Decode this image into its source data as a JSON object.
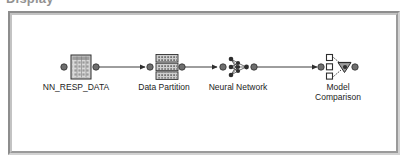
{
  "caption": {
    "text": "Display"
  },
  "frame": {
    "name": "process-flow-diagram",
    "background": "#ffffff",
    "border_shadow": "#8d8d8d",
    "border_highlight": "#d2d2d2"
  },
  "colors": {
    "ink": "#1c1c1c",
    "node_fill": "#b8b8b8",
    "node_fill_light": "#d9d9d9",
    "connector": "#4a4a4a",
    "port": "#6e6e6e",
    "label_text": "#1c1c1c"
  },
  "diagram": {
    "type": "process-flow",
    "nodes": [
      {
        "id": "nn_resp_data",
        "label": "NN_RESP_DATA",
        "icon": "data-table-icon",
        "kind": "input-data-source",
        "x": 66,
        "y": 50
      },
      {
        "id": "data_partition",
        "label": "Data Partition",
        "icon": "data-partition-icon",
        "kind": "sample",
        "x": 152,
        "y": 50
      },
      {
        "id": "neural_network",
        "label": "Neural Network",
        "icon": "neural-network-icon",
        "kind": "model",
        "x": 224,
        "y": 50
      },
      {
        "id": "model_comparison",
        "label": "Model\nComparison",
        "icon": "model-comparison-icon",
        "kind": "assess",
        "x": 324,
        "y": 50
      }
    ],
    "links": [
      {
        "id": "link-1",
        "from": "nn_resp_data",
        "to": "data_partition",
        "arrow": "right"
      },
      {
        "id": "link-2",
        "from": "data_partition",
        "to": "neural_network",
        "arrow": "right"
      },
      {
        "id": "link-3",
        "from": "neural_network",
        "to": "model_comparison",
        "arrow": "right"
      }
    ]
  }
}
